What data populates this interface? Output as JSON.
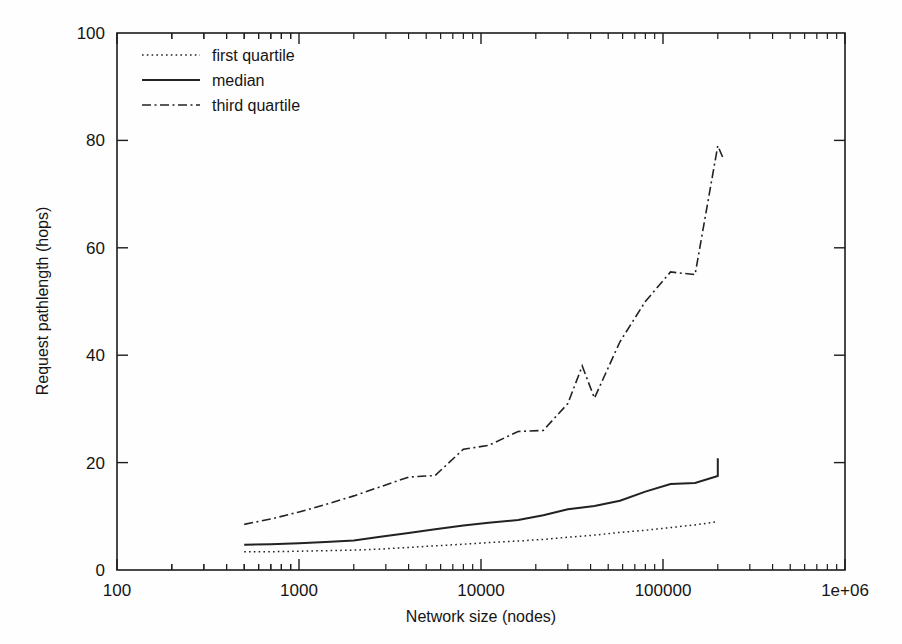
{
  "chart_data": {
    "type": "line",
    "title": "",
    "xlabel": "Network size (nodes)",
    "ylabel": "Request pathlength (hops)",
    "xscale": "log",
    "yscale": "linear",
    "xlim": [
      100,
      1000000
    ],
    "ylim": [
      0,
      100
    ],
    "grid": false,
    "legend_position": "upper left",
    "xticks": [
      {
        "value": 100,
        "label": "100"
      },
      {
        "value": 1000,
        "label": "1000"
      },
      {
        "value": 10000,
        "label": "10000"
      },
      {
        "value": 100000,
        "label": "100000"
      },
      {
        "value": 1000000,
        "label": "1e+06"
      }
    ],
    "yticks": [
      {
        "value": 0,
        "label": "0"
      },
      {
        "value": 20,
        "label": "20"
      },
      {
        "value": 40,
        "label": "40"
      },
      {
        "value": 60,
        "label": "60"
      },
      {
        "value": 80,
        "label": "80"
      },
      {
        "value": 100,
        "label": "100"
      }
    ],
    "series": [
      {
        "name": "first quartile",
        "style": "dotted",
        "color": "#222222",
        "x": [
          500,
          700,
          1000,
          1400,
          2000,
          2800,
          4000,
          5600,
          8000,
          11000,
          16000,
          22000,
          30000,
          42000,
          58000,
          80000,
          110000,
          150000,
          200000
        ],
        "y": [
          3.4,
          3.4,
          3.5,
          3.6,
          3.7,
          3.9,
          4.2,
          4.5,
          4.8,
          5.1,
          5.4,
          5.7,
          6.1,
          6.5,
          7.0,
          7.4,
          7.9,
          8.4,
          9.0
        ]
      },
      {
        "name": "median",
        "style": "solid",
        "color": "#222222",
        "x": [
          500,
          700,
          1000,
          1400,
          2000,
          2800,
          4000,
          5600,
          8000,
          11000,
          16000,
          22000,
          30000,
          42000,
          58000,
          80000,
          110000,
          150000,
          200000
        ],
        "y": [
          4.7,
          4.8,
          5.0,
          5.2,
          5.5,
          6.2,
          6.9,
          7.6,
          8.3,
          8.8,
          9.3,
          10.2,
          11.3,
          11.9,
          12.9,
          14.6,
          16.0,
          16.2,
          17.5
        ]
      },
      {
        "name": "third quartile",
        "style": "dash-dot",
        "color": "#222222",
        "x": [
          500,
          700,
          1000,
          1400,
          2000,
          2800,
          4000,
          5600,
          8000,
          11000,
          16000,
          22000,
          30000,
          36000,
          42000,
          58000,
          80000,
          110000,
          150000,
          200000
        ],
        "y": [
          8.5,
          9.5,
          10.8,
          12.2,
          13.8,
          15.5,
          17.3,
          17.6,
          22.5,
          23.2,
          25.8,
          26.0,
          31.0,
          38.0,
          32.0,
          42.5,
          50.0,
          55.5,
          55.0,
          79.0
        ]
      }
    ],
    "notes": {
      "median_end": 20.8,
      "third_quartile_peak": 79.0,
      "third_quartile_final": 76.5
    }
  },
  "legend": {
    "entries": [
      {
        "label": "first quartile"
      },
      {
        "label": "median"
      },
      {
        "label": "third quartile"
      }
    ]
  },
  "axes": {
    "xlabel": "Network size (nodes)",
    "ylabel": "Request pathlength (hops)"
  }
}
